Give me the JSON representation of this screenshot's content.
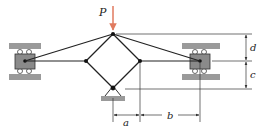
{
  "diagram": {
    "type": "mechanism-linkage",
    "labels": {
      "load": "P",
      "dim_d": "d",
      "dim_c": "c",
      "dim_a": "a",
      "dim_b": "b"
    },
    "colors": {
      "load_arrow": "#e07a5f",
      "member": "#222222",
      "guide": "#9a9a9a",
      "slider": "#8a8a8a",
      "dimension": "#333333"
    },
    "joints": {
      "top": [
        113,
        34
      ],
      "left": [
        86,
        61
      ],
      "right": [
        140,
        61
      ],
      "bottom_pin": [
        113,
        88
      ],
      "left_slider": [
        25,
        61
      ],
      "right_slider": [
        200,
        61
      ]
    }
  }
}
